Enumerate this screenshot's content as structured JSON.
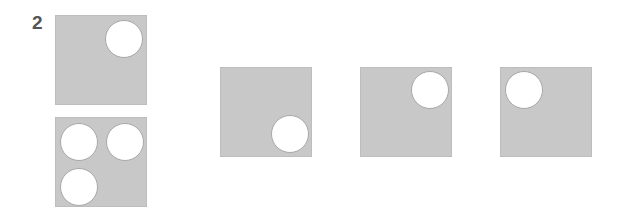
{
  "question": {
    "number": "2"
  },
  "colors": {
    "panel": "#c8c8c8",
    "hole": "#ffffff",
    "number": "#555555"
  },
  "stimulus": [
    {
      "id": "stimulus-top",
      "holes": [
        "top-right"
      ]
    },
    {
      "id": "stimulus-bottom",
      "holes": [
        "top-left",
        "top-right",
        "bottom-left"
      ]
    }
  ],
  "options": [
    {
      "id": "option-a",
      "holes": [
        "bottom-right"
      ]
    },
    {
      "id": "option-b",
      "holes": [
        "top-right"
      ]
    },
    {
      "id": "option-c",
      "holes": [
        "top-left"
      ]
    }
  ]
}
